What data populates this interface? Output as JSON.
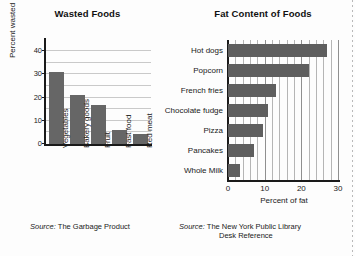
{
  "chart_data": [
    {
      "type": "bar",
      "orientation": "vertical",
      "title": "Wasted Foods",
      "categories": [
        "Vegetables",
        "Bakery goods",
        "Fruit",
        "Fast food",
        "Red meat"
      ],
      "values": [
        31,
        21,
        17,
        6,
        4.5
      ],
      "xlabel": "",
      "ylabel": "Percent wasted",
      "ylim": [
        0,
        44
      ],
      "yticks": [
        0,
        10,
        20,
        30,
        40
      ],
      "gridlines": [
        5,
        10,
        15,
        20,
        25,
        30,
        35,
        40
      ],
      "grid": true,
      "legend": false,
      "source": "Source: The Garbage Product",
      "source_prefix": "Source:",
      "source_text": "The Garbage Product",
      "bar_color": "#666666"
    },
    {
      "type": "bar",
      "orientation": "horizontal",
      "title": "Fat Content of Foods",
      "categories": [
        "Hot dogs",
        "Popcorn",
        "French fries",
        "Chocolate fudge",
        "Pizza",
        "Pancakes",
        "Whole Milk"
      ],
      "values": [
        27,
        22,
        13,
        11,
        9.5,
        7,
        3.3
      ],
      "xlabel": "Percent of fat",
      "ylabel": "",
      "xlim": [
        0,
        30
      ],
      "xticks": [
        0,
        10,
        20,
        30
      ],
      "gridlines": [
        2,
        4,
        6,
        8,
        10,
        12,
        14,
        16,
        18,
        20,
        22,
        24,
        26,
        28,
        30
      ],
      "grid": true,
      "legend": false,
      "source": "Source: The New York Public Library Desk Reference",
      "source_prefix": "Source:",
      "source_line1": "The New York Public Library",
      "source_line2": "Desk Reference",
      "bar_color": "#5e5e5e"
    }
  ]
}
